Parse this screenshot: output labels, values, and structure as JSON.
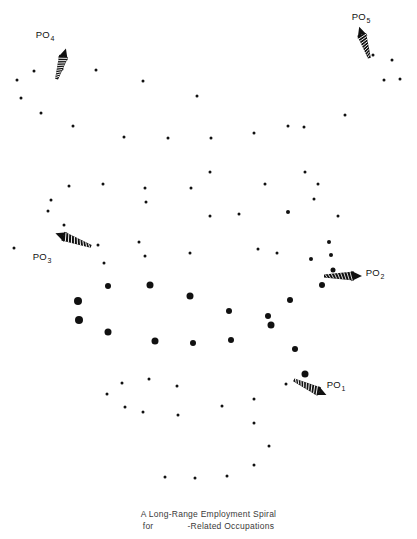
{
  "figure": {
    "width": 417,
    "height": 539,
    "background": "#ffffff",
    "dot_color": "#111111"
  },
  "caption": {
    "line1": "A Long-Range Employment Spiral",
    "line2_before_gap": "for",
    "line2_after_gap": "-Related Occupations",
    "x": 208,
    "y": 508
  },
  "annotations": [
    {
      "id": "po1",
      "label": "PO",
      "subscript": "1",
      "label_x": 336,
      "label_y": 384,
      "arrow_x": 292,
      "arrow_y": 368,
      "arrow_length": 36,
      "arrow_angle_deg": 25,
      "direction": "down-right"
    },
    {
      "id": "po2",
      "label": "PO",
      "subscript": "2",
      "label_x": 375,
      "label_y": 272,
      "arrow_x": 322,
      "arrow_y": 265,
      "arrow_length": 38,
      "arrow_angle_deg": 0,
      "direction": "right"
    },
    {
      "id": "po3",
      "label": "PO",
      "subscript": "3",
      "label_x": 42,
      "label_y": 256,
      "arrow_x": 93,
      "arrow_y": 236,
      "arrow_length": 38,
      "arrow_angle_deg": 200,
      "direction": "up-left"
    },
    {
      "id": "po4",
      "label": "PO",
      "subscript": "4",
      "label_x": 45,
      "label_y": 34,
      "arrow_x": 56,
      "arrow_y": 70,
      "arrow_length": 32,
      "arrow_angle_deg": 287,
      "direction": "up"
    },
    {
      "id": "po5",
      "label": "PO",
      "subscript": "5",
      "label_x": 361,
      "label_y": 16,
      "arrow_x": 370,
      "arrow_y": 49,
      "arrow_length": 33,
      "arrow_angle_deg": 252,
      "direction": "up-left"
    }
  ],
  "chart_data": {
    "type": "scatter",
    "title": "A Long-Range Employment Spiral",
    "subtitle": "for -Related Occupations",
    "xlabel": "",
    "ylabel": "",
    "xlim": [
      0,
      417
    ],
    "ylim": [
      0,
      539
    ],
    "grid": false,
    "legend": "none",
    "axes_visible": false,
    "size_encoding": "marker radius increases toward the centre of the spiral",
    "marker_sizes_px": {
      "small": 3,
      "medium": 5,
      "large": 8
    },
    "points": [
      {
        "x": 17,
        "y": 80,
        "size": 3
      },
      {
        "x": 34,
        "y": 71,
        "size": 3
      },
      {
        "x": 62,
        "y": 69,
        "size": 3
      },
      {
        "x": 96,
        "y": 70,
        "size": 3
      },
      {
        "x": 21,
        "y": 98,
        "size": 3
      },
      {
        "x": 41,
        "y": 113,
        "size": 3
      },
      {
        "x": 73,
        "y": 126,
        "size": 3
      },
      {
        "x": 124,
        "y": 137,
        "size": 3
      },
      {
        "x": 143,
        "y": 81,
        "size": 3
      },
      {
        "x": 168,
        "y": 138,
        "size": 3
      },
      {
        "x": 197,
        "y": 96,
        "size": 3
      },
      {
        "x": 211,
        "y": 138,
        "size": 3
      },
      {
        "x": 254,
        "y": 133,
        "size": 3
      },
      {
        "x": 288,
        "y": 126,
        "size": 3
      },
      {
        "x": 304,
        "y": 127,
        "size": 3
      },
      {
        "x": 345,
        "y": 115,
        "size": 3
      },
      {
        "x": 373,
        "y": 55,
        "size": 3
      },
      {
        "x": 392,
        "y": 60,
        "size": 3
      },
      {
        "x": 384,
        "y": 80,
        "size": 3
      },
      {
        "x": 400,
        "y": 79,
        "size": 3
      },
      {
        "x": 69,
        "y": 186,
        "size": 3
      },
      {
        "x": 51,
        "y": 200,
        "size": 3
      },
      {
        "x": 48,
        "y": 211,
        "size": 3
      },
      {
        "x": 103,
        "y": 184,
        "size": 3
      },
      {
        "x": 145,
        "y": 188,
        "size": 3
      },
      {
        "x": 191,
        "y": 188,
        "size": 3
      },
      {
        "x": 64,
        "y": 225,
        "size": 3
      },
      {
        "x": 146,
        "y": 202,
        "size": 3
      },
      {
        "x": 239,
        "y": 214,
        "size": 3
      },
      {
        "x": 265,
        "y": 184,
        "size": 3
      },
      {
        "x": 305,
        "y": 172,
        "size": 3
      },
      {
        "x": 318,
        "y": 184,
        "size": 3
      },
      {
        "x": 210,
        "y": 172,
        "size": 3
      },
      {
        "x": 314,
        "y": 199,
        "size": 3
      },
      {
        "x": 338,
        "y": 216,
        "size": 3
      },
      {
        "x": 98,
        "y": 245,
        "size": 3
      },
      {
        "x": 139,
        "y": 242,
        "size": 3
      },
      {
        "x": 210,
        "y": 216,
        "size": 3
      },
      {
        "x": 288,
        "y": 212,
        "size": 4
      },
      {
        "x": 104,
        "y": 263,
        "size": 3
      },
      {
        "x": 145,
        "y": 256,
        "size": 3
      },
      {
        "x": 190,
        "y": 253,
        "size": 3
      },
      {
        "x": 258,
        "y": 249,
        "size": 3
      },
      {
        "x": 277,
        "y": 253,
        "size": 3
      },
      {
        "x": 14,
        "y": 248,
        "size": 3
      },
      {
        "x": 329,
        "y": 242,
        "size": 4
      },
      {
        "x": 331,
        "y": 255,
        "size": 4
      },
      {
        "x": 311,
        "y": 259,
        "size": 4
      },
      {
        "x": 322,
        "y": 285,
        "size": 6
      },
      {
        "x": 333,
        "y": 270,
        "size": 5
      },
      {
        "x": 108,
        "y": 286,
        "size": 6
      },
      {
        "x": 150,
        "y": 285,
        "size": 7
      },
      {
        "x": 190,
        "y": 296,
        "size": 7
      },
      {
        "x": 78,
        "y": 301,
        "size": 8
      },
      {
        "x": 229,
        "y": 311,
        "size": 6
      },
      {
        "x": 268,
        "y": 316,
        "size": 6
      },
      {
        "x": 290,
        "y": 300,
        "size": 6
      },
      {
        "x": 79,
        "y": 320,
        "size": 8
      },
      {
        "x": 108,
        "y": 332,
        "size": 7
      },
      {
        "x": 155,
        "y": 341,
        "size": 7
      },
      {
        "x": 193,
        "y": 343,
        "size": 6
      },
      {
        "x": 231,
        "y": 340,
        "size": 6
      },
      {
        "x": 271,
        "y": 325,
        "size": 7
      },
      {
        "x": 295,
        "y": 349,
        "size": 6
      },
      {
        "x": 305,
        "y": 374,
        "size": 7
      },
      {
        "x": 122,
        "y": 383,
        "size": 3
      },
      {
        "x": 149,
        "y": 379,
        "size": 3
      },
      {
        "x": 107,
        "y": 394,
        "size": 3
      },
      {
        "x": 125,
        "y": 407,
        "size": 3
      },
      {
        "x": 143,
        "y": 412,
        "size": 3
      },
      {
        "x": 177,
        "y": 386,
        "size": 3
      },
      {
        "x": 178,
        "y": 415,
        "size": 3
      },
      {
        "x": 222,
        "y": 406,
        "size": 3
      },
      {
        "x": 254,
        "y": 399,
        "size": 3
      },
      {
        "x": 254,
        "y": 423,
        "size": 3
      },
      {
        "x": 286,
        "y": 384,
        "size": 3
      },
      {
        "x": 269,
        "y": 446,
        "size": 3
      },
      {
        "x": 254,
        "y": 465,
        "size": 3
      },
      {
        "x": 227,
        "y": 476,
        "size": 3
      },
      {
        "x": 195,
        "y": 478,
        "size": 3
      },
      {
        "x": 165,
        "y": 477,
        "size": 3
      }
    ]
  }
}
